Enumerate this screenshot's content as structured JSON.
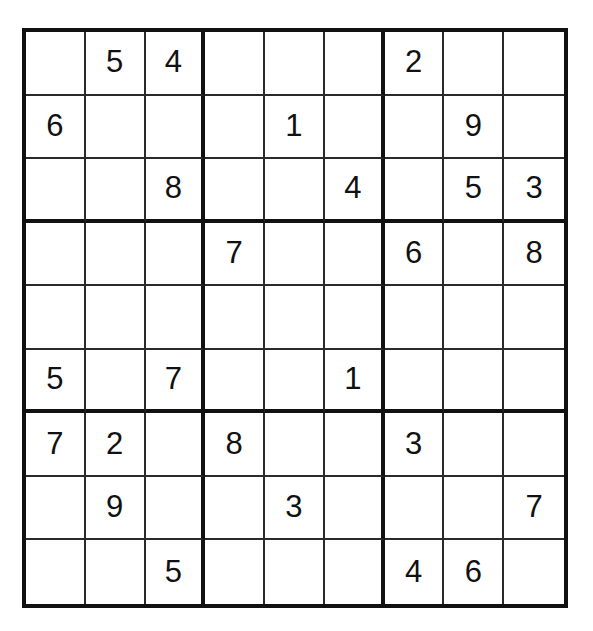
{
  "puzzle": {
    "kind": "sudoku-grid",
    "size": 9,
    "box_size": 3,
    "empty_marker": "",
    "colors": {
      "background": "#ffffff",
      "thick_line": "#111111",
      "thin_line": "#2a2a2a",
      "digit": "#111111"
    },
    "rows": [
      {
        "label": "row-1",
        "cells": [
          "",
          "5",
          "4",
          "",
          "",
          "",
          "2",
          "",
          ""
        ]
      },
      {
        "label": "row-2",
        "cells": [
          "6",
          "",
          "",
          "",
          "1",
          "",
          "",
          "9",
          ""
        ]
      },
      {
        "label": "row-3",
        "cells": [
          "",
          "",
          "8",
          "",
          "",
          "4",
          "",
          "5",
          "3"
        ]
      },
      {
        "label": "row-4",
        "cells": [
          "",
          "",
          "",
          "7",
          "",
          "",
          "6",
          "",
          "8"
        ]
      },
      {
        "label": "row-5",
        "cells": [
          "",
          "",
          "",
          "",
          "",
          "",
          "",
          "",
          ""
        ]
      },
      {
        "label": "row-6",
        "cells": [
          "5",
          "",
          "7",
          "",
          "",
          "1",
          "",
          "",
          ""
        ]
      },
      {
        "label": "row-7",
        "cells": [
          "7",
          "2",
          "",
          "8",
          "",
          "",
          "3",
          "",
          ""
        ]
      },
      {
        "label": "row-8",
        "cells": [
          "",
          "9",
          "",
          "",
          "3",
          "",
          "",
          "",
          "7"
        ]
      },
      {
        "label": "row-9",
        "cells": [
          "",
          "",
          "5",
          "",
          "",
          "",
          "4",
          "6",
          ""
        ]
      }
    ]
  }
}
